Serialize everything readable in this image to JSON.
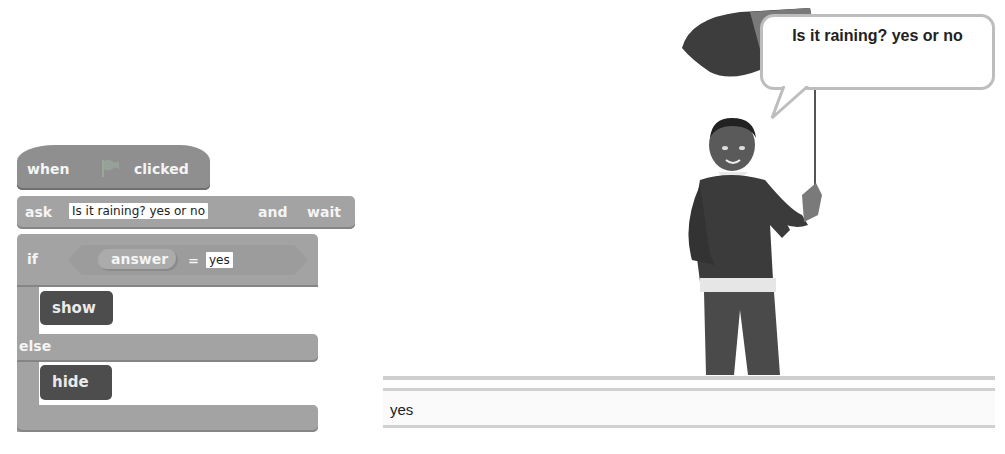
{
  "script": {
    "hat": {
      "when": "when",
      "icon": "green-flag-icon",
      "clicked": "clicked"
    },
    "ask": {
      "label": "ask",
      "question": "Is it raining? yes or no",
      "and": "and",
      "wait": "wait"
    },
    "if_block": {
      "if": "if",
      "reporter": "answer",
      "operator": "=",
      "value": "yes",
      "then": "then",
      "else": "else"
    },
    "show": "show",
    "hide": "hide"
  },
  "stage": {
    "speech_bubble": "Is it raining? yes or no",
    "answer_value": "yes"
  },
  "colors": {
    "control": "#a3a3a3",
    "events": "#8f8f8f",
    "looks": "#4d4d4d",
    "bubble_border": "#bdbdbd"
  }
}
